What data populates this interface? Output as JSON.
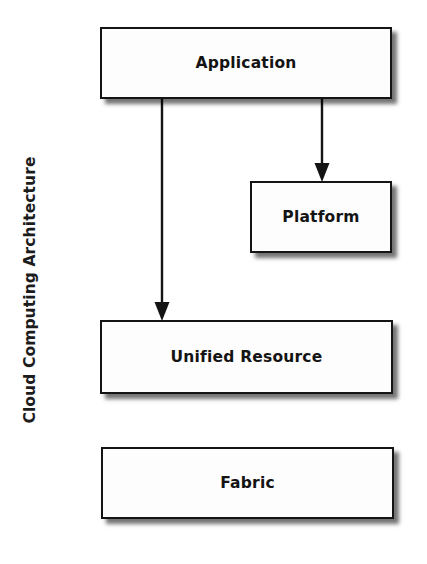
{
  "diagram": {
    "caption": "Cloud Computing Architecture",
    "type": "layered-block-diagram",
    "background_color": "#ffffff",
    "line_color": "#141414",
    "box_fill_color": "#fdfdfd",
    "nodes": [
      {
        "id": "application",
        "label": "Application",
        "x": 100,
        "y": 27,
        "width": 292,
        "height": 72
      },
      {
        "id": "platform",
        "label": "Platform",
        "x": 250,
        "y": 181,
        "width": 142,
        "height": 72
      },
      {
        "id": "unified_resource",
        "label": "Unified Resource",
        "x": 100,
        "y": 320,
        "width": 293,
        "height": 74
      },
      {
        "id": "fabric",
        "label": "Fabric",
        "x": 101,
        "y": 447,
        "width": 293,
        "height": 72
      }
    ],
    "edges": [
      {
        "id": "application-to-platform",
        "from": "application",
        "to": "platform",
        "style": "solid",
        "arrow": "end",
        "x": 322,
        "y_start": 99,
        "y_end": 181
      },
      {
        "id": "application-to-unified-resource",
        "from": "application",
        "to": "unified_resource",
        "style": "solid",
        "arrow": "end",
        "x": 162,
        "y_start": 99,
        "y_end": 320
      }
    ]
  }
}
